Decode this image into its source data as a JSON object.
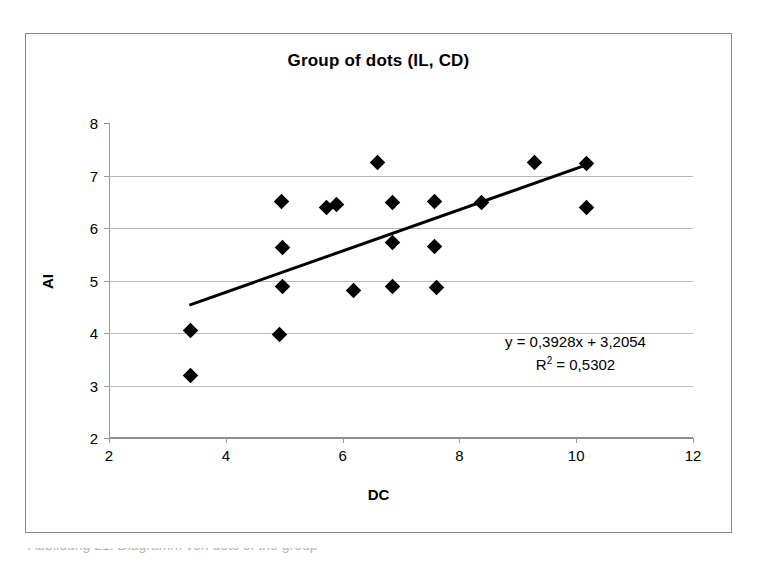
{
  "chart_data": {
    "type": "scatter",
    "title": "Group of dots (IL, CD)",
    "xlabel": "DC",
    "ylabel": "AI",
    "xlim": [
      2,
      12
    ],
    "ylim": [
      2,
      8
    ],
    "xticks": [
      2,
      4,
      6,
      8,
      10,
      12
    ],
    "yticks": [
      2,
      3,
      4,
      5,
      6,
      7,
      8
    ],
    "grid": "horizontal",
    "legend": "none",
    "marker": "diamond",
    "marker_color": "#000000",
    "points": [
      {
        "x": 3.4,
        "y": 4.05
      },
      {
        "x": 3.4,
        "y": 3.2
      },
      {
        "x": 4.95,
        "y": 6.5
      },
      {
        "x": 4.97,
        "y": 5.63
      },
      {
        "x": 4.97,
        "y": 4.88
      },
      {
        "x": 4.92,
        "y": 3.97
      },
      {
        "x": 5.72,
        "y": 6.4
      },
      {
        "x": 5.9,
        "y": 6.45
      },
      {
        "x": 6.18,
        "y": 4.81
      },
      {
        "x": 6.6,
        "y": 7.24
      },
      {
        "x": 6.86,
        "y": 6.48
      },
      {
        "x": 6.86,
        "y": 5.72
      },
      {
        "x": 6.86,
        "y": 4.88
      },
      {
        "x": 7.58,
        "y": 6.5
      },
      {
        "x": 7.58,
        "y": 5.64
      },
      {
        "x": 7.6,
        "y": 4.87
      },
      {
        "x": 8.37,
        "y": 6.48
      },
      {
        "x": 9.29,
        "y": 7.24
      },
      {
        "x": 10.18,
        "y": 7.23
      },
      {
        "x": 10.17,
        "y": 6.39
      }
    ],
    "trendline": {
      "slope": 0.3928,
      "intercept": 3.2054,
      "x_start": 3.4,
      "x_end": 10.2,
      "color": "#000000",
      "width": 3
    },
    "annotation": {
      "equation": "y = 0,3928x + 3,2054",
      "r_squared_prefix": "R",
      "r_squared_exponent": "2",
      "r_squared_value": " = 0,5302"
    }
  },
  "caption": {
    "text": "Abbildung 21. Diagramm von dots of the group"
  }
}
